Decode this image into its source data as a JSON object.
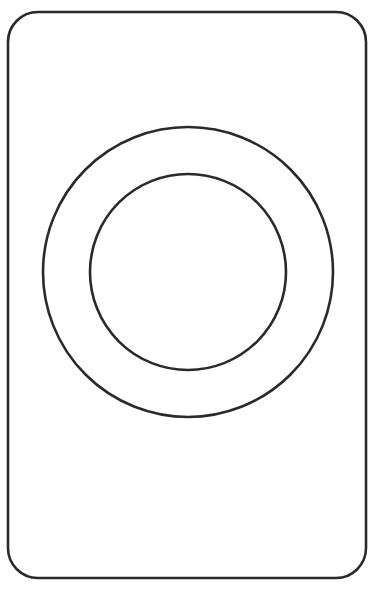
{
  "document": {
    "title": "Line Drawing",
    "kind": "monochrome-line-art",
    "description": "Outlined rounded rectangle containing two concentric circles forming a ring",
    "canvas": {
      "width": 374,
      "height": 590,
      "background_color": "#ffffff"
    }
  },
  "palette": {
    "stroke_color": "#2a2a2a",
    "fill_color": "#ffffff",
    "background_color": "#ffffff"
  },
  "shapes": {
    "plate": {
      "name": "rounded-rectangle-outline",
      "x": 8,
      "y": 12,
      "width": 358,
      "height": 566,
      "corner_radius": 30,
      "stroke_width": 2.6,
      "fill": "#ffffff",
      "stroke": "#2a2a2a"
    },
    "outer_circle": {
      "name": "outer-circle-outline",
      "center_x": 188,
      "center_y": 272,
      "radius": 145,
      "stroke_width": 2.6,
      "fill": "none",
      "stroke": "#2a2a2a"
    },
    "inner_circle": {
      "name": "inner-circle-outline",
      "center_x": 188,
      "center_y": 272,
      "radius": 98,
      "stroke_width": 2.6,
      "fill": "none",
      "stroke": "#2a2a2a"
    }
  },
  "annotations": {
    "ring_band_width": 47,
    "shape_count": 3,
    "has_text": false,
    "has_color_fill": false
  }
}
